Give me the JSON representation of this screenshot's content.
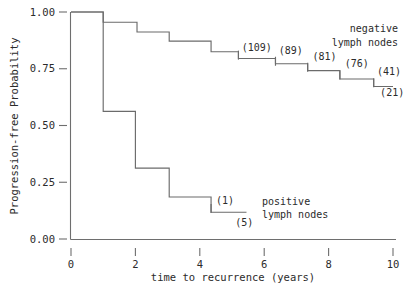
{
  "chart_data": {
    "type": "line",
    "title": "",
    "xlabel": "time to recurrence (years)",
    "ylabel": "Progression-free Probability",
    "xlim": [
      0,
      10
    ],
    "ylim": [
      0.0,
      1.0
    ],
    "xticks": [
      "0",
      "2",
      "4",
      "6",
      "8",
      "10"
    ],
    "xtick_values": [
      0,
      2,
      4,
      6,
      8,
      10
    ],
    "yticks": [
      "0.00",
      "0.25",
      "0.50",
      "0.75",
      "1.00"
    ],
    "ytick_values": [
      0.0,
      0.25,
      0.5,
      0.75,
      1.0
    ],
    "grid": false,
    "legend_position": "inline-annotations",
    "series": [
      {
        "name": "negative lymph nodes",
        "label_lines": [
          "negative",
          "lymph nodes"
        ],
        "steps": [
          {
            "x": 0.0,
            "y": 1.0
          },
          {
            "x": 1.0,
            "y": 1.0
          },
          {
            "x": 1.0,
            "y": 0.955
          },
          {
            "x": 2.05,
            "y": 0.955
          },
          {
            "x": 2.05,
            "y": 0.912
          },
          {
            "x": 3.05,
            "y": 0.912
          },
          {
            "x": 3.05,
            "y": 0.872
          },
          {
            "x": 4.35,
            "y": 0.872
          },
          {
            "x": 4.35,
            "y": 0.825
          },
          {
            "x": 5.2,
            "y": 0.825
          },
          {
            "x": 5.2,
            "y": 0.795
          },
          {
            "x": 6.35,
            "y": 0.795
          },
          {
            "x": 6.35,
            "y": 0.772
          },
          {
            "x": 7.35,
            "y": 0.772
          },
          {
            "x": 7.35,
            "y": 0.742
          },
          {
            "x": 8.35,
            "y": 0.742
          },
          {
            "x": 8.35,
            "y": 0.705
          },
          {
            "x": 9.4,
            "y": 0.705
          },
          {
            "x": 9.4,
            "y": 0.672
          },
          {
            "x": 10.0,
            "y": 0.672
          }
        ],
        "censor_marks": [
          {
            "x": 5.2,
            "y": 0.81
          },
          {
            "x": 6.35,
            "y": 0.783
          },
          {
            "x": 7.35,
            "y": 0.757
          },
          {
            "x": 8.35,
            "y": 0.723
          },
          {
            "x": 9.4,
            "y": 0.688
          }
        ],
        "annotations": [
          {
            "text": "(109)",
            "x": 5.3,
            "y": 0.83
          },
          {
            "text": "(89)",
            "x": 6.45,
            "y": 0.815
          },
          {
            "text": "(81)",
            "x": 7.5,
            "y": 0.79
          },
          {
            "text": "(76)",
            "x": 8.5,
            "y": 0.757
          },
          {
            "text": "(41)",
            "x": 9.5,
            "y": 0.722
          },
          {
            "text": "(21)",
            "x": 9.6,
            "y": 0.628
          }
        ]
      },
      {
        "name": "positive lymph nodes",
        "label_lines": [
          "positive",
          "lymph nodes"
        ],
        "steps": [
          {
            "x": 0.0,
            "y": 1.0
          },
          {
            "x": 1.0,
            "y": 1.0
          },
          {
            "x": 1.0,
            "y": 0.562
          },
          {
            "x": 2.0,
            "y": 0.562
          },
          {
            "x": 2.0,
            "y": 0.312
          },
          {
            "x": 3.05,
            "y": 0.312
          },
          {
            "x": 3.05,
            "y": 0.185
          },
          {
            "x": 4.35,
            "y": 0.185
          },
          {
            "x": 4.35,
            "y": 0.118
          },
          {
            "x": 5.45,
            "y": 0.118
          }
        ],
        "censor_marks": [
          {
            "x": 4.35,
            "y": 0.134
          }
        ],
        "annotations": [
          {
            "text": "(1)",
            "x": 4.5,
            "y": 0.155
          },
          {
            "text": "(5)",
            "x": 5.1,
            "y": 0.058
          }
        ]
      }
    ]
  },
  "colors": {
    "curve": "#6b6b6b",
    "axis": "#6e6e6e",
    "text": "#2b2b2b",
    "background": "#ffffff"
  }
}
